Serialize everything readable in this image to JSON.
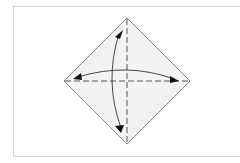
{
  "diagram": {
    "type": "origami-fold-step",
    "colors": {
      "paper_fill": "#f3f3f3",
      "paper_edge": "#7a7a7a",
      "fold_line": "#555555",
      "arrow": "#333333",
      "arrowhead": "#111111",
      "frame": "#d4d4d4"
    },
    "diamond": {
      "top": [
        127,
        18
      ],
      "right": [
        190,
        81
      ],
      "bottom": [
        127,
        144
      ],
      "left": [
        64,
        81
      ]
    },
    "folds": [
      {
        "name": "vertical-valley-fold",
        "style": "dashed"
      },
      {
        "name": "horizontal-valley-fold",
        "style": "dashed"
      }
    ],
    "arrows": [
      {
        "name": "vertical-fold-unfold-arrow",
        "heads": 2
      },
      {
        "name": "horizontal-fold-unfold-arrow",
        "heads": 2
      }
    ]
  }
}
